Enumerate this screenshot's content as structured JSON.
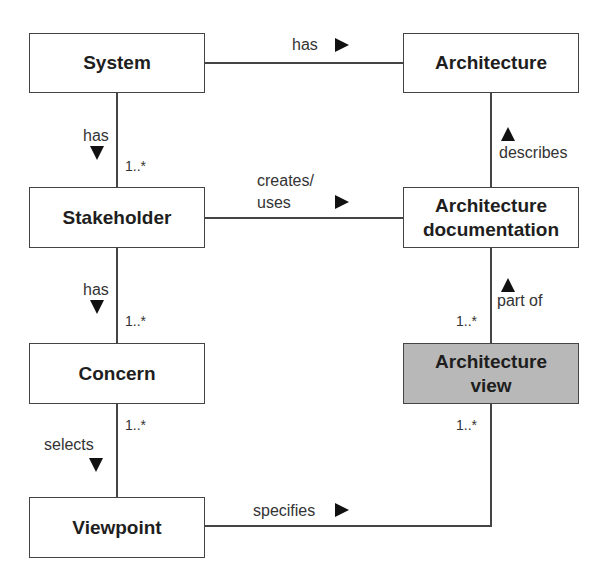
{
  "diagram": {
    "type": "class-diagram",
    "nodes": {
      "system": "System",
      "architecture": "Architecture",
      "stakeholder": "Stakeholder",
      "architecture_documentation": "Architecture documentation",
      "concern": "Concern",
      "architecture_view": "Architecture view",
      "viewpoint": "Viewpoint"
    },
    "node_lines": {
      "architecture_documentation": [
        "Architecture",
        "documentation"
      ],
      "architecture_view": [
        "Architecture",
        "view"
      ]
    },
    "edges": [
      {
        "from": "System",
        "to": "Architecture",
        "label": "has",
        "direction": "right"
      },
      {
        "from": "System",
        "to": "Stakeholder",
        "label": "has",
        "direction": "down",
        "multiplicity": "1..*"
      },
      {
        "from": "Stakeholder",
        "to": "Architecture documentation",
        "label": "creates/ uses",
        "direction": "right"
      },
      {
        "from": "Architecture documentation",
        "to": "Architecture",
        "label": "describes",
        "direction": "up"
      },
      {
        "from": "Stakeholder",
        "to": "Concern",
        "label": "has",
        "direction": "down",
        "multiplicity": "1..*"
      },
      {
        "from": "Architecture view",
        "to": "Architecture documentation",
        "label": "part of",
        "direction": "up",
        "multiplicity": "1..*"
      },
      {
        "from": "Concern",
        "to": "Viewpoint",
        "label": "selects",
        "direction": "down",
        "multiplicity": "1..*"
      },
      {
        "from": "Viewpoint",
        "to": "Architecture view",
        "label": "specifies",
        "direction": "right",
        "multiplicity": "1..*"
      }
    ],
    "labels": {
      "has_top": "has",
      "has_sys_stake": "has",
      "creates": "creates/",
      "uses": "uses",
      "describes": "describes",
      "has_stake_concern": "has",
      "part_of": "part of",
      "selects": "selects",
      "specifies": "specifies"
    },
    "multiplicities": {
      "sys_stake": "1..*",
      "stake_concern": "1..*",
      "doc_view": "1..*",
      "concern_viewpoint": "1..*",
      "view_viewpoint": "1..*"
    },
    "colors": {
      "highlight_fill": "#b8b8b8",
      "line": "#444444"
    }
  }
}
